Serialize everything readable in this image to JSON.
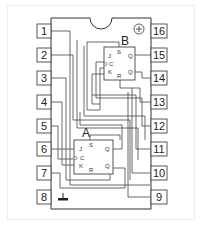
{
  "diagram": {
    "chip": {
      "power_symbol": "⊕",
      "ground_symbol": "ground"
    },
    "pins_left": [
      {
        "num": "1"
      },
      {
        "num": "2"
      },
      {
        "num": "3"
      },
      {
        "num": "4"
      },
      {
        "num": "5"
      },
      {
        "num": "6"
      },
      {
        "num": "7"
      },
      {
        "num": "8"
      }
    ],
    "pins_right": [
      {
        "num": "16"
      },
      {
        "num": "15"
      },
      {
        "num": "14"
      },
      {
        "num": "13"
      },
      {
        "num": "12"
      },
      {
        "num": "11"
      },
      {
        "num": "10"
      },
      {
        "num": "9"
      }
    ],
    "flipflops": [
      {
        "name": "A",
        "ports": {
          "j": "J",
          "c": "C",
          "k": "K",
          "s": "S",
          "r": "R",
          "q": "Q",
          "qbar": "Q"
        }
      },
      {
        "name": "B",
        "ports": {
          "j": "J",
          "c": "C",
          "k": "K",
          "s": "S",
          "r": "R",
          "q": "Q",
          "qbar": "Q"
        }
      }
    ]
  }
}
